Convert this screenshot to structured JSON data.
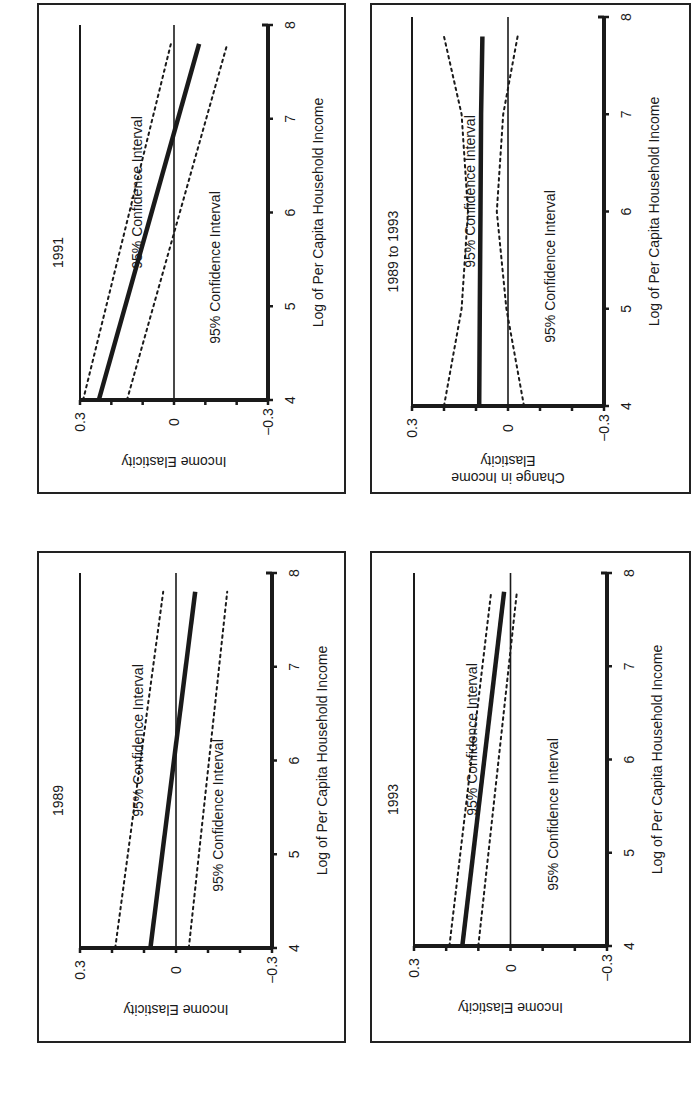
{
  "figure": {
    "orientation": "rotated 90 degrees counter-clockwise (text reads bottom-to-top)",
    "ci_label": "95% Confidence Interval",
    "x_axis_label": "Log of Per Capita Household Income",
    "x_ticks": [
      "4",
      "5",
      "6",
      "7",
      "8"
    ],
    "y_ticks": [
      "0.3",
      "0",
      "−0.3"
    ]
  },
  "panels": [
    {
      "id": "1991",
      "title": "1991",
      "ylabel": "Income Elasticity"
    },
    {
      "id": "1989to1993",
      "title": "1989 to 1993",
      "ylabel_line1": "Change in Income",
      "ylabel_line2": "Elasticity"
    },
    {
      "id": "1989",
      "title": "1989",
      "ylabel": "Income Elasticity"
    },
    {
      "id": "1993",
      "title": "1993",
      "ylabel": "Income Elasticity"
    }
  ],
  "chart_data": [
    {
      "type": "line",
      "title": "1991",
      "xlabel": "Log of Per Capita Household Income",
      "ylabel": "Income Elasticity",
      "xlim": [
        4,
        8
      ],
      "ylim": [
        -0.3,
        0.3
      ],
      "x_ticks": [
        4,
        5,
        6,
        7,
        8
      ],
      "y_ticks": [
        -0.3,
        0,
        0.3
      ],
      "reference_line": 0,
      "x": [
        4.0,
        7.8
      ],
      "series": [
        {
          "name": "Estimate",
          "style": "solid-thick",
          "values": [
            0.24,
            -0.08
          ]
        },
        {
          "name": "95% Confidence Interval (upper)",
          "style": "dotted",
          "values": [
            0.29,
            0.01
          ]
        },
        {
          "name": "95% Confidence Interval (lower)",
          "style": "dotted",
          "values": [
            0.15,
            -0.17
          ]
        }
      ],
      "annotations": [
        "95% Confidence Interval",
        "95% Confidence Interval"
      ]
    },
    {
      "type": "line",
      "title": "1989 to 1993",
      "xlabel": "Log of Per Capita Household Income",
      "ylabel": "Change in Income Elasticity",
      "xlim": [
        4,
        8
      ],
      "ylim": [
        -0.3,
        0.3
      ],
      "x_ticks": [
        4,
        5,
        6,
        7,
        8
      ],
      "y_ticks": [
        -0.3,
        0,
        0.3
      ],
      "reference_line": 0,
      "x": [
        4.0,
        5.0,
        6.0,
        7.0,
        7.8
      ],
      "series": [
        {
          "name": "Estimate",
          "style": "solid-thick",
          "values": [
            0.09,
            0.088,
            0.086,
            0.084,
            0.08
          ]
        },
        {
          "name": "95% Confidence Interval (upper)",
          "style": "dotted",
          "values": [
            0.2,
            0.145,
            0.125,
            0.145,
            0.2
          ]
        },
        {
          "name": "95% Confidence Interval (lower)",
          "style": "dotted",
          "values": [
            -0.05,
            0.005,
            0.035,
            0.015,
            -0.03
          ]
        }
      ],
      "annotations": [
        "95% Confidence Interval",
        "95% Confidence Interval"
      ]
    },
    {
      "type": "line",
      "title": "1989",
      "xlabel": "Log of Per Capita Household Income",
      "ylabel": "Income Elasticity",
      "xlim": [
        4,
        8
      ],
      "ylim": [
        -0.3,
        0.3
      ],
      "x_ticks": [
        4,
        5,
        6,
        7,
        8
      ],
      "y_ticks": [
        -0.3,
        0,
        0.3
      ],
      "reference_line": 0,
      "x": [
        4.0,
        7.8
      ],
      "series": [
        {
          "name": "Estimate",
          "style": "solid-thick",
          "values": [
            0.08,
            -0.06
          ]
        },
        {
          "name": "95% Confidence Interval (upper)",
          "style": "dotted",
          "values": [
            0.19,
            0.04
          ]
        },
        {
          "name": "95% Confidence Interval (lower)",
          "style": "dotted",
          "values": [
            -0.04,
            -0.16
          ]
        }
      ],
      "annotations": [
        "95% Confidence Interval",
        "95% Confidence Interval"
      ]
    },
    {
      "type": "line",
      "title": "1993",
      "xlabel": "Log of Per Capita Household Income",
      "ylabel": "Income Elasticity",
      "xlim": [
        4,
        8
      ],
      "ylim": [
        -0.3,
        0.3
      ],
      "x_ticks": [
        4,
        5,
        6,
        7,
        8
      ],
      "y_ticks": [
        -0.3,
        0,
        0.3
      ],
      "reference_line": 0,
      "x": [
        4.0,
        7.8
      ],
      "series": [
        {
          "name": "Estimate",
          "style": "solid-thick",
          "values": [
            0.15,
            0.02
          ]
        },
        {
          "name": "95% Confidence Interval (upper)",
          "style": "dotted",
          "values": [
            0.19,
            0.06
          ]
        },
        {
          "name": "95% Confidence Interval (lower)",
          "style": "dotted",
          "values": [
            0.1,
            -0.02
          ]
        }
      ],
      "annotations": [
        "95% Confidence Interval",
        "95% Confidence Interval"
      ]
    }
  ]
}
